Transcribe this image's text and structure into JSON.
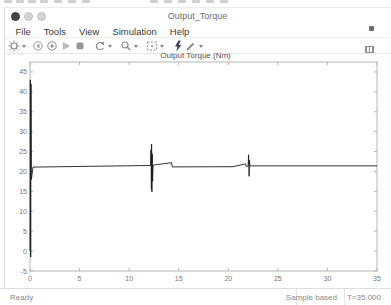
{
  "window": {
    "title": "Output_Torque",
    "traffic_lights": [
      "close",
      "minimize",
      "maximize"
    ]
  },
  "menu": {
    "items": [
      "File",
      "Tools",
      "View",
      "Simulation",
      "Help"
    ]
  },
  "toolbar": {
    "icons": [
      "settings-gear",
      "step-back",
      "run",
      "step-forward",
      "stop",
      "restore-view",
      "zoom",
      "fit-to-view",
      "trigger-bolt",
      "measurements"
    ],
    "colors": {
      "icon_gray": "#8a8a8a",
      "trigger_dark": "#3b3f5c"
    }
  },
  "statusbar": {
    "ready": "Ready",
    "sample_mode": "Sample based",
    "time": "T=35.000"
  },
  "chart_data": {
    "type": "line",
    "title": "Output Torque (Nm)",
    "xlabel": "",
    "ylabel": "",
    "xlim": [
      0,
      35
    ],
    "ylim": [
      -5,
      47.5
    ],
    "xticks": [
      0,
      5,
      10,
      15,
      20,
      25,
      30,
      35
    ],
    "yticks": [
      -5,
      0,
      5,
      10,
      15,
      20,
      25,
      30,
      35,
      40,
      45
    ],
    "grid": false,
    "legend": null,
    "axis_color": "#b5b5b5",
    "tick_label_color": "#777777",
    "line_color": "#1c1c1c",
    "series": [
      {
        "name": "Output Torque",
        "points": [
          [
            0,
            0
          ],
          [
            0.03,
            43
          ],
          [
            0.07,
            -1.5
          ],
          [
            0.1,
            42
          ],
          [
            0.14,
            18
          ],
          [
            0.3,
            21.1
          ],
          [
            6,
            21.3
          ],
          [
            12.15,
            21.5
          ],
          [
            12.2,
            25.5
          ],
          [
            12.24,
            15.5
          ],
          [
            12.27,
            26.9
          ],
          [
            12.3,
            14.9
          ],
          [
            12.33,
            24.5
          ],
          [
            12.37,
            17.5
          ],
          [
            12.42,
            21.6
          ],
          [
            14.28,
            22.2
          ],
          [
            14.35,
            21.15
          ],
          [
            20.5,
            21.2
          ],
          [
            21.75,
            21.9
          ],
          [
            21.82,
            21.3
          ],
          [
            22.0,
            21.3
          ],
          [
            22.05,
            24.2
          ],
          [
            22.1,
            18.8
          ],
          [
            22.14,
            22.8
          ],
          [
            22.18,
            21.4
          ],
          [
            35,
            21.4
          ]
        ]
      }
    ],
    "steady_state_value": 21.4,
    "initial_transient_peak": 43
  }
}
